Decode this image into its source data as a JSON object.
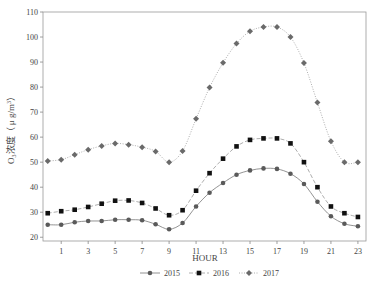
{
  "chart_data": {
    "type": "line",
    "title": "",
    "xlabel": "HOUR",
    "ylabel": "O3浓度（μg/m³）",
    "ylabel_parts": {
      "base": "O",
      "sub": "3",
      "rest": "浓度（ μ g/m",
      "sup": "3",
      "close": "）"
    },
    "x": [
      0,
      1,
      2,
      3,
      4,
      5,
      6,
      7,
      8,
      9,
      10,
      11,
      12,
      13,
      14,
      15,
      16,
      17,
      18,
      19,
      20,
      21,
      22,
      23
    ],
    "x_ticks": [
      1,
      3,
      5,
      7,
      9,
      11,
      13,
      15,
      17,
      19,
      21,
      23
    ],
    "y_ticks": [
      20,
      30,
      40,
      50,
      60,
      70,
      80,
      90,
      100,
      110
    ],
    "ylim": [
      18.5,
      110
    ],
    "xlim": [
      -0.35,
      23.6
    ],
    "grid": false,
    "legend_position": "bottom",
    "series": [
      {
        "name": "2015",
        "marker": "circle",
        "line": "solid",
        "color": "#5a5a5a",
        "values": [
          25,
          25,
          26,
          26.5,
          26.5,
          27,
          27,
          26.8,
          25.2,
          23.2,
          25.7,
          32.3,
          37.8,
          41.7,
          45,
          46.7,
          47.5,
          47.3,
          45.4,
          41.3,
          34.2,
          28.4,
          25.4,
          24.4
        ]
      },
      {
        "name": "2016",
        "marker": "square",
        "line": "dashed",
        "color": "#111111",
        "values": [
          29.6,
          30.4,
          31,
          32.1,
          33.4,
          34.6,
          34.7,
          33.7,
          31.5,
          28.8,
          30.8,
          38.6,
          45.6,
          51.4,
          56.3,
          58.9,
          59.5,
          59.5,
          57.5,
          50,
          40,
          32.3,
          29.6,
          28.1
        ]
      },
      {
        "name": "2017",
        "marker": "diamond",
        "line": "dotted",
        "color": "#6a6a6a",
        "values": [
          50.5,
          51,
          53,
          55,
          56.5,
          57.5,
          57,
          56,
          54.3,
          50,
          54.5,
          67.3,
          79.8,
          89.7,
          97.4,
          102.3,
          104,
          104,
          100,
          89.6,
          73.8,
          58.4,
          50,
          50
        ]
      }
    ]
  }
}
